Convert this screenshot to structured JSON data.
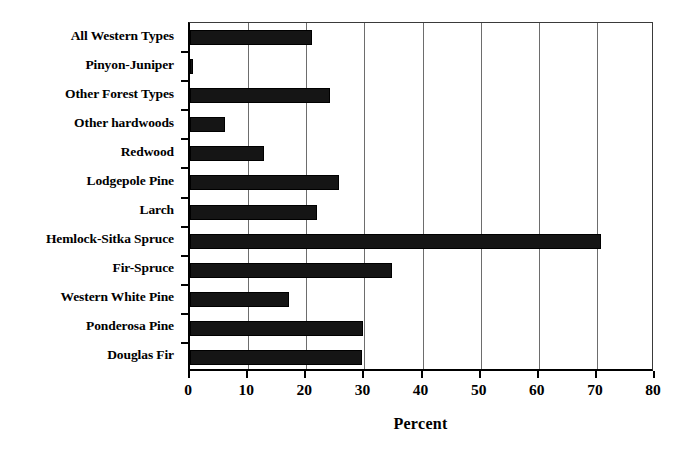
{
  "chart_data": {
    "type": "bar",
    "orientation": "horizontal",
    "title": "",
    "subtitle": "",
    "xlabel": "Percent",
    "ylabel": "",
    "xlim": [
      0,
      80
    ],
    "xticks": [
      0,
      10,
      20,
      30,
      40,
      50,
      60,
      70,
      80
    ],
    "xtick_labels": [
      "0",
      "10",
      "20",
      "30",
      "40",
      "50",
      "60",
      "70",
      "80"
    ],
    "grid": "vertical",
    "legend": null,
    "legend_position": "none",
    "bar_color": "#151515",
    "categories": [
      "All Western Types",
      "Pinyon-Juniper",
      "Other Forest Types",
      "Other hardwoods",
      "Redwood",
      "Lodgepole Pine",
      "Larch",
      "Hemlock-Sitka Spruce",
      "Fir-Spruce",
      "Western White Pine",
      "Ponderosa Pine",
      "Douglas Fir"
    ],
    "values": [
      21.0,
      0.5,
      24.0,
      6.0,
      12.7,
      25.6,
      21.8,
      70.7,
      34.8,
      17.0,
      29.7,
      29.6
    ]
  }
}
